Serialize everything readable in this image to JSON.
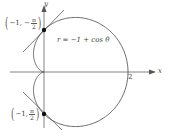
{
  "diagram": {
    "equation": "r = −1 + cos θ",
    "axes": {
      "x_label": "x",
      "y_label": "y",
      "x_tick": "2"
    },
    "points": [
      {
        "r": "−1,",
        "theta_sign": "−",
        "theta_num": "π",
        "theta_den": "2",
        "label_text": "(−1, −π/2)"
      },
      {
        "r": "−1,",
        "theta_sign": "",
        "theta_num": "π",
        "theta_den": "2",
        "label_text": "(−1, π/2)"
      }
    ],
    "colors": {
      "curve": "#444444",
      "axes": "#666666",
      "point": "#111111"
    }
  }
}
